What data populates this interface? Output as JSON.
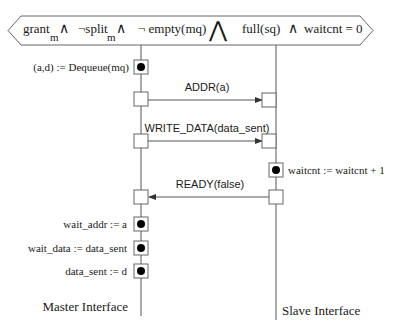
{
  "guard": {
    "term1": "grant",
    "term1_sub": "m",
    "and1": "∧",
    "term2": "¬split",
    "term2_sub": "m",
    "and2": "∧",
    "term3": "¬ empty(mq)",
    "big_and": "⋀",
    "term4": "full(sq)",
    "and3": "∧",
    "term5": "waitcnt = 0"
  },
  "lifelines": {
    "master": {
      "label": "Master Interface"
    },
    "slave": {
      "label": "Slave Interface"
    }
  },
  "actions": {
    "dequeue": "(a,d) := Dequeue(mq)",
    "waitcnt_inc": "waitcnt := waitcnt + 1",
    "wait_addr": "wait_addr := a",
    "wait_data": "wait_data := data_sent",
    "data_sent": "data_sent := d"
  },
  "messages": {
    "addr": "ADDR(a)",
    "write_data": "WRITE_DATA(data_sent)",
    "ready": "READY(false)"
  },
  "colors": {
    "line": "#555555",
    "text": "#1a1a1a",
    "dot": "#000000"
  }
}
